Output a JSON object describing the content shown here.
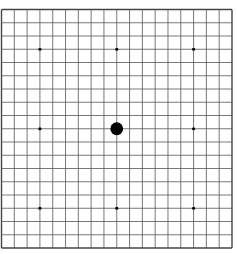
{
  "game": {
    "type": "go",
    "board_size": 19,
    "colors": {
      "background": "#ffffff",
      "line": "#555555",
      "border": "#444444",
      "star": "#000000",
      "black_stone": "#000000"
    },
    "star_points": [
      [
        3,
        3
      ],
      [
        9,
        3
      ],
      [
        15,
        3
      ],
      [
        3,
        9
      ],
      [
        15,
        9
      ],
      [
        3,
        15
      ],
      [
        9,
        15
      ],
      [
        15,
        15
      ]
    ],
    "stones": [
      {
        "color": "black",
        "col": 9,
        "row": 9
      }
    ]
  }
}
